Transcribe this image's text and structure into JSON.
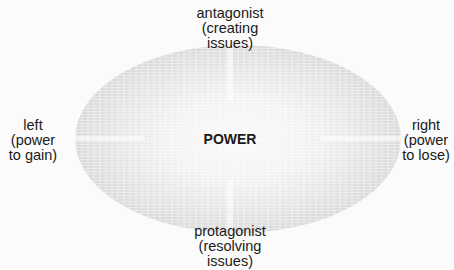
{
  "diagram": {
    "center_label": "POWER",
    "top": {
      "lines": [
        "antagonist",
        "(creating",
        "issues)"
      ]
    },
    "bottom": {
      "lines": [
        "protagonist",
        "(resolving",
        "issues)"
      ]
    },
    "left": {
      "lines": [
        "left",
        "(power",
        "to gain)"
      ]
    },
    "right": {
      "lines": [
        "right",
        "(power",
        "to lose)"
      ]
    }
  },
  "colors": {
    "background": "#fbfbfb",
    "ellipse_edge": "#cfcfcf",
    "ellipse_center": "#fafafa",
    "text": "#1a1a1a"
  }
}
